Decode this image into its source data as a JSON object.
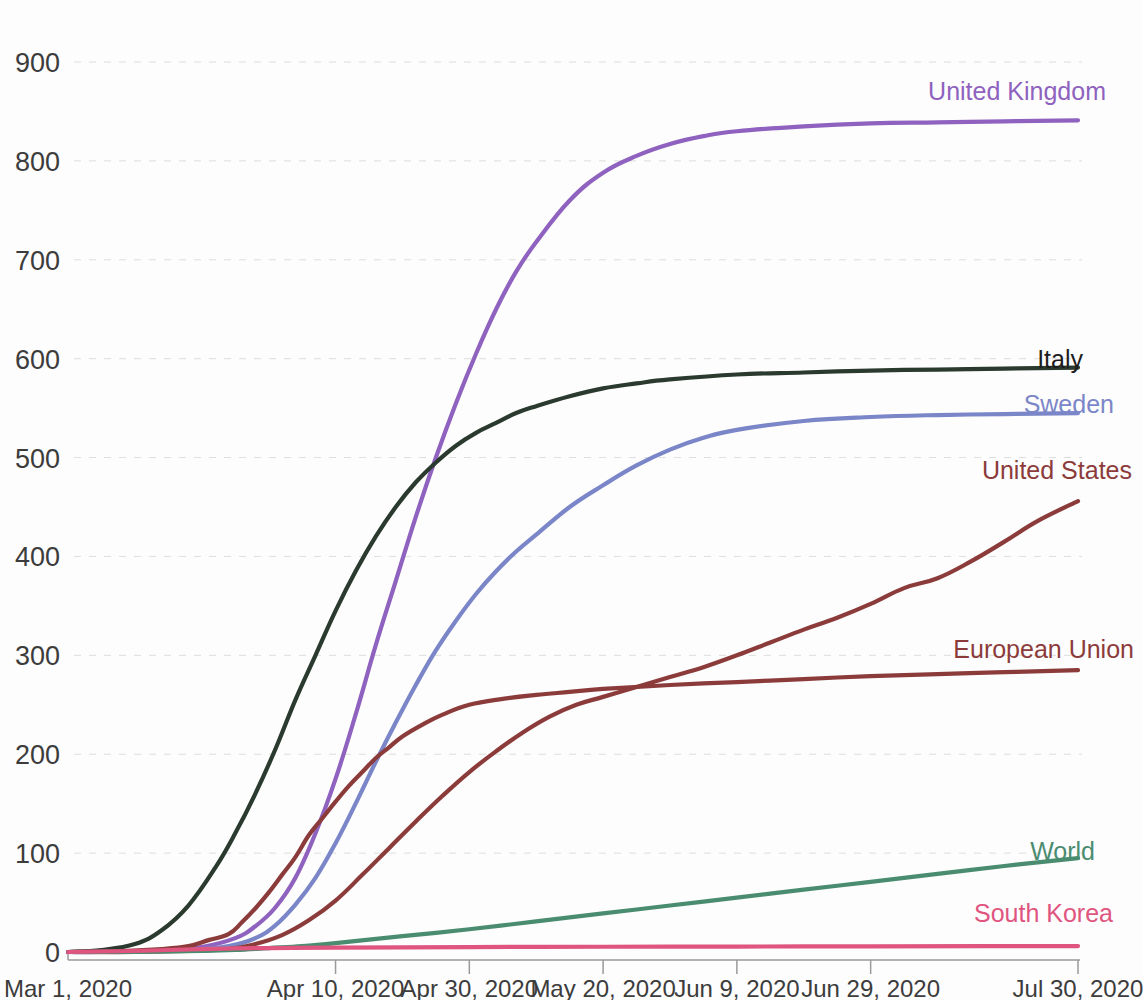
{
  "chart_data": {
    "type": "line",
    "title": "",
    "subtitle": "",
    "xlabel": "",
    "ylabel": "",
    "grid": true,
    "legend_position": "right-inline-end-of-line",
    "ylim": [
      0,
      940
    ],
    "yticks": [
      0,
      100,
      200,
      300,
      400,
      500,
      600,
      700,
      800,
      900
    ],
    "ytick_labels": [
      "0",
      "100",
      "200",
      "300",
      "400",
      "500",
      "600",
      "700",
      "800",
      "900"
    ],
    "xticks": [
      0,
      40,
      60,
      80,
      100,
      120,
      151
    ],
    "xtick_labels": [
      "Mar 1, 2020",
      "Apr 10, 2020",
      "Apr 30, 2020",
      "May 20, 2020",
      "Jun 9, 2020",
      "Jun 29, 2020",
      "Jul 30, 2020"
    ],
    "x_domain": [
      0,
      151
    ],
    "x_unit": "days since Mar 1, 2020",
    "series": [
      {
        "name": "United Kingdom",
        "color": "#8e62be",
        "label_color": "#8e62be",
        "x": [
          0,
          5,
          10,
          15,
          20,
          25,
          28,
          31,
          34,
          37,
          40,
          43,
          46,
          49,
          52,
          55,
          58,
          61,
          64,
          67,
          70,
          75,
          80,
          85,
          90,
          95,
          100,
          110,
          120,
          130,
          140,
          151
        ],
        "values": [
          0,
          0,
          1,
          2,
          5,
          14,
          26,
          45,
          75,
          120,
          175,
          240,
          310,
          375,
          440,
          500,
          555,
          605,
          650,
          688,
          718,
          760,
          788,
          805,
          817,
          825,
          830,
          835,
          838,
          839,
          840,
          841
        ]
      },
      {
        "name": "Italy",
        "color": "#2b3a2e",
        "label_color": "#1d1d1d",
        "x": [
          0,
          5,
          10,
          14,
          18,
          22,
          25,
          28,
          31,
          34,
          37,
          40,
          43,
          46,
          49,
          52,
          55,
          58,
          61,
          64,
          67,
          70,
          75,
          80,
          85,
          90,
          100,
          110,
          120,
          130,
          140,
          151
        ],
        "values": [
          0,
          2,
          8,
          22,
          47,
          85,
          120,
          160,
          205,
          255,
          300,
          345,
          385,
          420,
          450,
          475,
          495,
          512,
          525,
          535,
          545,
          552,
          562,
          570,
          575,
          579,
          584,
          586,
          588,
          589,
          590,
          591
        ]
      },
      {
        "name": "Sweden",
        "color": "#7a86c8",
        "label_color": "#7a86c8",
        "x": [
          0,
          10,
          18,
          24,
          28,
          31,
          34,
          37,
          40,
          43,
          46,
          49,
          52,
          55,
          58,
          61,
          64,
          67,
          70,
          75,
          80,
          85,
          90,
          95,
          100,
          110,
          120,
          130,
          140,
          151
        ],
        "values": [
          0,
          1,
          2,
          6,
          14,
          27,
          48,
          75,
          110,
          150,
          192,
          232,
          270,
          305,
          335,
          362,
          385,
          405,
          422,
          450,
          472,
          492,
          508,
          520,
          528,
          537,
          541,
          543,
          544,
          545
        ]
      },
      {
        "name": "United States",
        "color": "#8c3b3b",
        "label_color": "#8c3b3b",
        "x": [
          0,
          10,
          18,
          24,
          28,
          32,
          36,
          40,
          44,
          48,
          52,
          56,
          60,
          64,
          68,
          72,
          76,
          80,
          85,
          90,
          95,
          100,
          105,
          110,
          115,
          120,
          125,
          130,
          135,
          140,
          145,
          151
        ],
        "values": [
          0,
          0,
          1,
          3,
          8,
          17,
          32,
          52,
          78,
          105,
          132,
          158,
          182,
          203,
          222,
          238,
          250,
          258,
          268,
          278,
          288,
          300,
          313,
          326,
          338,
          352,
          368,
          378,
          395,
          415,
          436,
          456
        ]
      },
      {
        "name": "European Union",
        "color": "#8c3b3b",
        "label_color": "#8c3b3b",
        "x": [
          0,
          8,
          14,
          18,
          21,
          24,
          26,
          28,
          30,
          32,
          34,
          36,
          38,
          40,
          42,
          44,
          46,
          48,
          50,
          53,
          56,
          60,
          65,
          70,
          75,
          80,
          90,
          100,
          110,
          120,
          130,
          140,
          151
        ],
        "values": [
          0,
          1,
          3,
          6,
          12,
          18,
          30,
          44,
          60,
          78,
          96,
          118,
          135,
          152,
          168,
          182,
          196,
          207,
          218,
          230,
          240,
          250,
          256,
          260,
          263,
          266,
          270,
          273,
          276,
          279,
          281,
          283,
          285
        ]
      },
      {
        "name": "World",
        "color": "#4a8c70",
        "label_color": "#4a8c70",
        "x": [
          0,
          10,
          20,
          25,
          30,
          35,
          40,
          50,
          60,
          70,
          80,
          90,
          100,
          110,
          120,
          130,
          140,
          151
        ],
        "values": [
          0,
          0,
          1,
          2,
          4,
          6,
          9,
          16,
          23,
          31,
          39,
          47,
          55,
          63,
          71,
          79,
          87,
          95
        ]
      },
      {
        "name": "South Korea",
        "color": "#e0557f",
        "label_color": "#e0557f",
        "x": [
          0,
          10,
          20,
          30,
          40,
          60,
          80,
          100,
          120,
          140,
          151
        ],
        "values": [
          0,
          1,
          3,
          4,
          4.5,
          5,
          5.3,
          5.5,
          5.7,
          5.9,
          6
        ]
      }
    ],
    "series_label_positions": [
      {
        "name": "United Kingdom",
        "x": 1106,
        "y": 100,
        "anchor": "end"
      },
      {
        "name": "Italy",
        "x": 1083,
        "y": 368,
        "anchor": "end"
      },
      {
        "name": "Sweden",
        "x": 1114,
        "y": 413,
        "anchor": "end"
      },
      {
        "name": "United States",
        "x": 1132,
        "y": 479,
        "anchor": "end"
      },
      {
        "name": "European Union",
        "x": 1134,
        "y": 658,
        "anchor": "end"
      },
      {
        "name": "World",
        "x": 1095,
        "y": 860,
        "anchor": "end"
      },
      {
        "name": "South Korea",
        "x": 1113,
        "y": 922,
        "anchor": "end"
      }
    ]
  }
}
